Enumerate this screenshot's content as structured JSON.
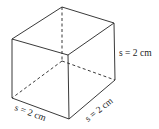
{
  "diagram": {
    "type": "cube",
    "labels": {
      "height": "s = 2 cm",
      "front_width": "s = 2 cm",
      "depth": "s = 2 cm"
    },
    "colors": {
      "stroke": "#222222",
      "background": "#ffffff"
    }
  }
}
